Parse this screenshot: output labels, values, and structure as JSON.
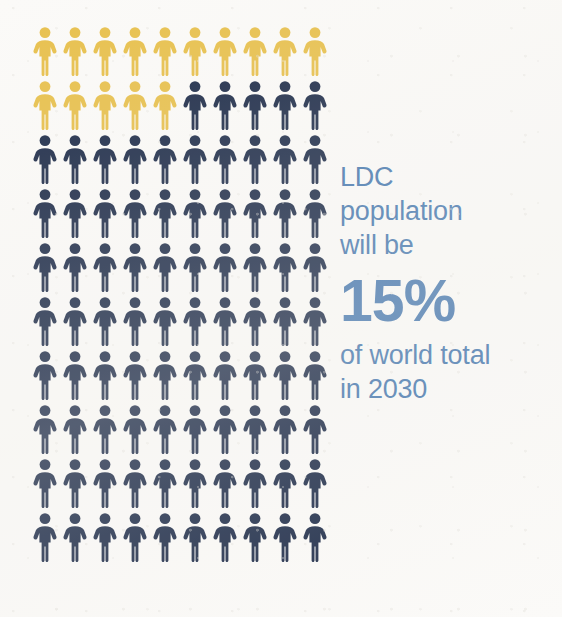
{
  "colors": {
    "background": "#fbfaf8",
    "highlight": "#e8c14f",
    "base": "#1f2d4a",
    "text_blue": "#4a7ab0"
  },
  "callout": {
    "line1": "LDC",
    "line2": "population",
    "line3": "will be",
    "stat": "15%",
    "line4": "of world total",
    "line5": "in 2030"
  },
  "chart_data": {
    "type": "pictogram",
    "title": "LDC population will be 15% of world total in 2030",
    "unit_label": "person",
    "unit_value": 1,
    "unit_suffix": "% of world population",
    "total_units": 100,
    "rows": 10,
    "columns": 10,
    "categories": [
      "LDC population",
      "Rest of world population"
    ],
    "values": [
      15,
      85
    ],
    "series": [
      {
        "name": "LDC population",
        "value": 15,
        "color": "#e8c14f",
        "icon": "person-icon"
      },
      {
        "name": "Rest of world population",
        "value": 85,
        "color": "#1f2d4a",
        "icon": "person-icon"
      }
    ],
    "fill_order": "row-major-left-to-right-top-to-bottom",
    "row_fills": [
      [
        "highlight",
        "highlight",
        "highlight",
        "highlight",
        "highlight",
        "highlight",
        "highlight",
        "highlight",
        "highlight",
        "highlight"
      ],
      [
        "highlight",
        "highlight",
        "highlight",
        "highlight",
        "highlight",
        "base",
        "base",
        "base",
        "base",
        "base"
      ],
      [
        "base",
        "base",
        "base",
        "base",
        "base",
        "base",
        "base",
        "base",
        "base",
        "base"
      ],
      [
        "base",
        "base",
        "base",
        "base",
        "base",
        "base",
        "base",
        "base",
        "base",
        "base"
      ],
      [
        "base",
        "base",
        "base",
        "base",
        "base",
        "base",
        "base",
        "base",
        "base",
        "base"
      ],
      [
        "base",
        "base",
        "base",
        "base",
        "base",
        "base",
        "base",
        "base",
        "base",
        "base"
      ],
      [
        "base",
        "base",
        "base",
        "base",
        "base",
        "base",
        "base",
        "base",
        "base",
        "base"
      ],
      [
        "base",
        "base",
        "base",
        "base",
        "base",
        "base",
        "base",
        "base",
        "base",
        "base"
      ],
      [
        "base",
        "base",
        "base",
        "base",
        "base",
        "base",
        "base",
        "base",
        "base",
        "base"
      ],
      [
        "base",
        "base",
        "base",
        "base",
        "base",
        "base",
        "base",
        "base",
        "base",
        "base"
      ]
    ],
    "xlabel": "",
    "ylabel": "",
    "legend": "none",
    "grid": false,
    "annotations": [
      "LDC population will be 15% of world total in 2030"
    ]
  }
}
